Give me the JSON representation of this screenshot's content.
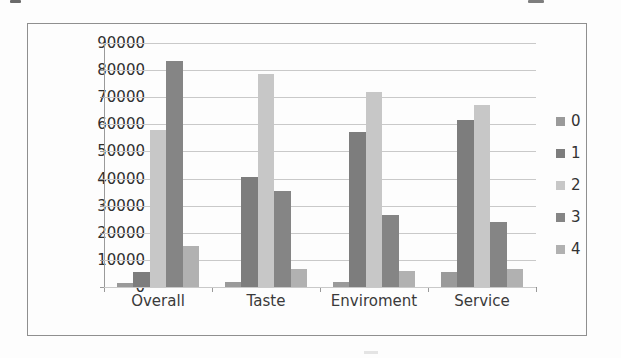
{
  "chart_data": {
    "type": "bar",
    "title": "",
    "xlabel": "",
    "ylabel": "",
    "categories": [
      "Overall",
      "Taste",
      "Enviroment",
      "Service"
    ],
    "series": [
      {
        "name": "0",
        "color": "#9a9a9a",
        "values": [
          1500,
          2000,
          2000,
          5500
        ]
      },
      {
        "name": "1",
        "color": "#7d7d7d",
        "values": [
          5500,
          40500,
          57000,
          61500
        ]
      },
      {
        "name": "2",
        "color": "#c7c7c7",
        "values": [
          58000,
          78500,
          72000,
          67000
        ]
      },
      {
        "name": "3",
        "color": "#858585",
        "values": [
          83500,
          35500,
          26500,
          24000
        ]
      },
      {
        "name": "4",
        "color": "#b1b1b1",
        "values": [
          15000,
          6500,
          6000,
          6500
        ]
      }
    ],
    "ylim": [
      0,
      90000
    ],
    "ytick_step": 10000,
    "yticks": [
      "90000",
      "80000",
      "70000",
      "60000",
      "50000",
      "40000",
      "30000",
      "20000",
      "10000",
      "0"
    ],
    "grid": true,
    "legend_position": "right"
  }
}
